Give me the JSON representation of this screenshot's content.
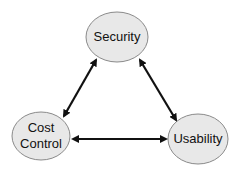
{
  "diagram": {
    "type": "triangle-tradeoff",
    "colors": {
      "node_fill": "#e8e8e8",
      "node_stroke": "#8a8a8a",
      "arrow": "#111111",
      "background": "#ffffff"
    },
    "nodes": [
      {
        "id": "security",
        "label": "Security",
        "cx": 117,
        "cy": 37,
        "rx": 31,
        "ry": 25
      },
      {
        "id": "cost-control",
        "label": "Cost\nControl",
        "cx": 41,
        "cy": 136,
        "rx": 29,
        "ry": 24
      },
      {
        "id": "usability",
        "label": "Usability",
        "cx": 198,
        "cy": 139,
        "rx": 30,
        "ry": 25
      }
    ],
    "edges": [
      {
        "from": "security",
        "to": "cost-control",
        "bidirectional": true
      },
      {
        "from": "security",
        "to": "usability",
        "bidirectional": true
      },
      {
        "from": "cost-control",
        "to": "usability",
        "bidirectional": true
      }
    ]
  }
}
